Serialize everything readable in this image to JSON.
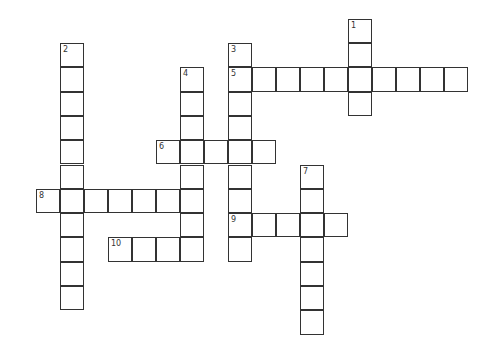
{
  "puzzle": {
    "grid": {
      "origin_x": 36,
      "origin_y": 43,
      "cell_w": 24,
      "cell_h": 24.3
    },
    "entries": [
      {
        "number": "1",
        "direction": "down",
        "col": 13,
        "row": -1,
        "length": 4
      },
      {
        "number": "2",
        "direction": "down",
        "col": 1,
        "row": 0,
        "length": 11
      },
      {
        "number": "3",
        "direction": "down",
        "col": 8,
        "row": 0,
        "length": 9
      },
      {
        "number": "4",
        "direction": "down",
        "col": 6,
        "row": 1,
        "length": 8
      },
      {
        "number": "5",
        "direction": "across",
        "col": 8,
        "row": 1,
        "length": 10
      },
      {
        "number": "6",
        "direction": "across",
        "col": 5,
        "row": 4,
        "length": 5
      },
      {
        "number": "7",
        "direction": "down",
        "col": 11,
        "row": 5,
        "length": 7
      },
      {
        "number": "8",
        "direction": "across",
        "col": 0,
        "row": 6,
        "length": 7
      },
      {
        "number": "9",
        "direction": "across",
        "col": 8,
        "row": 7,
        "length": 5
      },
      {
        "number": "10",
        "direction": "across",
        "col": 3,
        "row": 8,
        "length": 4
      }
    ]
  }
}
